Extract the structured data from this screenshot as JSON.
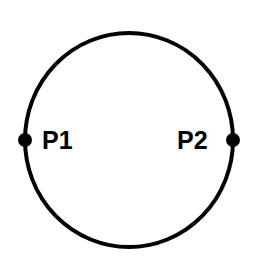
{
  "diagram": {
    "type": "circle-with-points",
    "circle": {
      "cx": 129,
      "cy": 140,
      "rx": 104,
      "ry": 107,
      "stroke": "#000000",
      "stroke_width": 4
    },
    "points": [
      {
        "id": "P1",
        "label": "P1",
        "cx": 25,
        "cy": 140,
        "label_x": 42,
        "label_y": 149
      },
      {
        "id": "P2",
        "label": "P2",
        "cx": 233,
        "cy": 140,
        "label_x": 177,
        "label_y": 149
      }
    ]
  }
}
